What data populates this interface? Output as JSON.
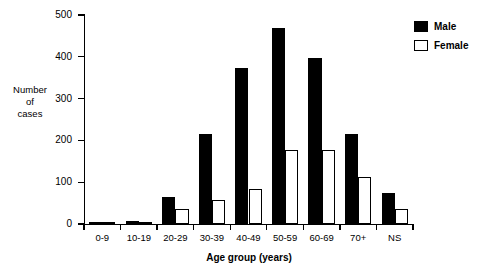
{
  "chart_data": {
    "type": "bar",
    "title": "",
    "subtitle": "",
    "xlabel": "Age group (years)",
    "ylabel": "Number of cases",
    "ylabel_lines": [
      "Number",
      "of",
      "cases"
    ],
    "categories": [
      "0-9",
      "10-19",
      "20-29",
      "30-39",
      "40-49",
      "50-59",
      "60-69",
      "70+",
      "NS"
    ],
    "series": [
      {
        "name": "Male",
        "color": "#000000",
        "values": [
          5,
          8,
          65,
          215,
          373,
          468,
          397,
          215,
          75
        ]
      },
      {
        "name": "Female",
        "color": "#ffffff",
        "values": [
          3,
          6,
          35,
          58,
          83,
          178,
          178,
          112,
          35
        ]
      }
    ],
    "ylim": [
      0,
      500
    ],
    "yticks": [
      0,
      100,
      200,
      300,
      400,
      500
    ],
    "ytick_labels": [
      "0",
      "100",
      "200",
      "300",
      "400",
      "500"
    ],
    "grid": false,
    "legend_position": "top-right",
    "legend": [
      {
        "label": "Male",
        "swatch": "filled-black-square"
      },
      {
        "label": "Female",
        "swatch": "open-white-square"
      }
    ]
  }
}
